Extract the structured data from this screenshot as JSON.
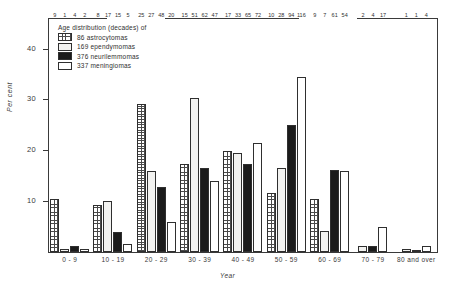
{
  "chart_data": {
    "type": "bar",
    "title": "",
    "xlabel": "Year",
    "ylabel": "Per cent",
    "ylim": [
      0,
      46
    ],
    "yticks": [
      10,
      20,
      30,
      40
    ],
    "grid": false,
    "legend_position": "top-left",
    "legend_title": "Age distribution (decades) of",
    "categories": [
      "0 - 9",
      "10 - 19",
      "20 - 29",
      "30 - 39",
      "40 - 49",
      "50 - 59",
      "60 - 69",
      "70 - 79",
      "80 and over"
    ],
    "series": [
      {
        "name": "86 astrocytomas",
        "key": "astrocytomas",
        "count": 86,
        "pattern": "cross-hatch",
        "values": [
          9,
          8,
          25,
          15,
          17,
          10,
          9,
          0,
          0
        ],
        "labels": [
          "9",
          "8",
          "25",
          "15",
          "17",
          "10",
          "9",
          "",
          ""
        ]
      },
      {
        "name": "169 ependymomas",
        "key": "ependymomas",
        "count": 169,
        "pattern": "solid-light",
        "values": [
          1,
          17,
          27,
          51,
          33,
          28,
          7,
          2,
          1
        ],
        "labels": [
          "1",
          "17",
          "27",
          "51",
          "33",
          "28",
          "7",
          "2",
          "1"
        ]
      },
      {
        "name": "376 neurilemmomas",
        "key": "neurilemmomas",
        "count": 376,
        "pattern": "solid-black",
        "values": [
          4,
          15,
          48,
          62,
          65,
          94,
          61,
          4,
          1
        ],
        "labels": [
          "4",
          "15",
          "48",
          "62",
          "65",
          "94",
          "61",
          "4",
          "1"
        ]
      },
      {
        "name": "337 meningiomas",
        "key": "meningiomas",
        "count": 337,
        "pattern": "stipple",
        "values": [
          2,
          5,
          20,
          47,
          72,
          116,
          54,
          17,
          4
        ],
        "labels": [
          "2",
          "5",
          "20",
          "47",
          "72",
          "116",
          "54",
          "17",
          "4"
        ]
      }
    ],
    "value_scale_note": "bar heights drawn on a per-cent scale; printed labels are case counts",
    "percent_series": [
      {
        "key": "astrocytomas",
        "percents": [
          10.5,
          9.3,
          29.1,
          17.4,
          19.8,
          11.6,
          10.5,
          0,
          0
        ]
      },
      {
        "key": "ependymomas",
        "percents": [
          0.6,
          10.1,
          16.0,
          30.2,
          19.5,
          16.6,
          4.1,
          1.2,
          0.6
        ]
      },
      {
        "key": "neurilemmomas",
        "percents": [
          1.1,
          4.0,
          12.8,
          16.5,
          17.3,
          25.0,
          16.2,
          1.1,
          0.3
        ]
      },
      {
        "key": "meningiomas",
        "percents": [
          0.6,
          1.5,
          5.9,
          13.9,
          21.4,
          34.4,
          16.0,
          5.0,
          1.2
        ]
      }
    ]
  },
  "colors": {
    "axis": "#3a3a3a",
    "bar_outline": "#2f2f2f",
    "astrocytomas": "#4a4a4a",
    "ependymomas": "#f2f2f0",
    "neurilemmomas": "#1b1b1b",
    "meningiomas": "#ffffff",
    "background": "#ffffff"
  }
}
